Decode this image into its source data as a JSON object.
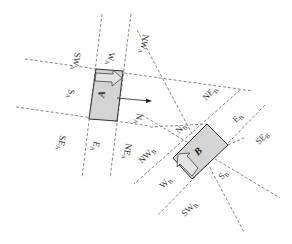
{
  "colors": {
    "background": "#ffffff",
    "dashed_line": "#777777",
    "vehicle_fill": "#d4d4d4",
    "vehicle_stroke": "#333333",
    "label": "#333333"
  },
  "vehicles": {
    "A": {
      "label": "A",
      "zone_labels": {
        "N": {
          "main": "N",
          "sub": "A"
        },
        "NE": {
          "main": "NE",
          "sub": "A"
        },
        "E": {
          "main": "E",
          "sub": "A"
        },
        "SE": {
          "main": "SE",
          "sub": "A"
        },
        "S": {
          "main": "S",
          "sub": "A"
        },
        "SW": {
          "main": "SW",
          "sub": "A"
        },
        "W": {
          "main": "W",
          "sub": "A"
        },
        "NW": {
          "main": "NW",
          "sub": "A"
        }
      }
    },
    "B": {
      "label": "B",
      "zone_labels": {
        "N": {
          "main": "N",
          "sub": "B"
        },
        "NE": {
          "main": "NE",
          "sub": "B"
        },
        "E": {
          "main": "E",
          "sub": "B"
        },
        "SE": {
          "main": "SE",
          "sub": "B"
        },
        "S": {
          "main": "S",
          "sub": "B"
        },
        "SW": {
          "main": "SW",
          "sub": "B"
        },
        "W": {
          "main": "W",
          "sub": "B"
        },
        "NW": {
          "main": "NW",
          "sub": "B"
        }
      }
    }
  }
}
